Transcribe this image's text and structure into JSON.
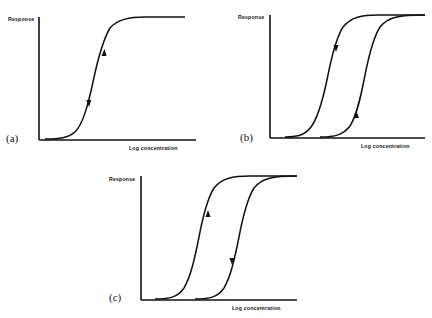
{
  "figure": {
    "panels": [
      {
        "id": "a",
        "label": "(a)",
        "ylabel": "Response",
        "xlabel": "Log concentration",
        "curves": [
          {
            "name": "single-curve",
            "arrows": [
              "up",
              "down"
            ],
            "description": "Single sigmoid; ascending and descending paths coincide (no hysteresis)"
          }
        ]
      },
      {
        "id": "b",
        "label": "(b)",
        "ylabel": "Response",
        "xlabel": "Log concentration",
        "curves": [
          {
            "name": "left-curve",
            "arrows": [
              "down"
            ],
            "description": "Left-shifted sigmoid, traversed downward (decreasing concentration)"
          },
          {
            "name": "right-curve",
            "arrows": [
              "up"
            ],
            "description": "Right-shifted sigmoid, traversed upward (increasing concentration)"
          }
        ]
      },
      {
        "id": "c",
        "label": "(c)",
        "ylabel": "Response",
        "xlabel": "Log concentration",
        "curves": [
          {
            "name": "left-curve",
            "arrows": [
              "up"
            ],
            "description": "Left-shifted sigmoid, traversed upward (increasing concentration)"
          },
          {
            "name": "right-curve",
            "arrows": [
              "down"
            ],
            "description": "Right-shifted sigmoid, traversed downward (decreasing concentration)"
          }
        ]
      }
    ]
  }
}
